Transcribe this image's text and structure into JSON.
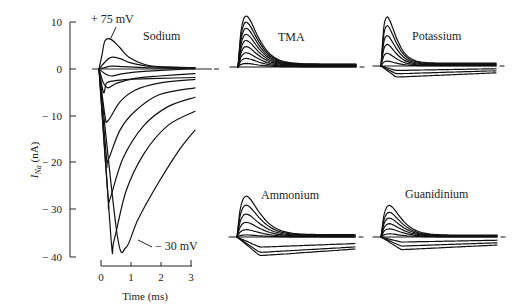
{
  "chart_data": [
    {
      "type": "line",
      "panel": "Sodium",
      "title": "Sodium",
      "xlabel": "Time (ms)",
      "ylabel": "I_Na (nA)",
      "xlim": [
        0,
        3.2
      ],
      "ylim": [
        -40,
        10
      ],
      "xticks": [
        0,
        1,
        2,
        3
      ],
      "yticks": [
        10,
        0,
        -10,
        -20,
        -30,
        -40
      ],
      "ytick_labels": [
        "10",
        "0",
        "− 10",
        "− 20",
        "− 30",
        "− 40"
      ],
      "grid": false,
      "annotations": [
        {
          "text": "+ 75 mV",
          "points_to": "top outward trace",
          "x": 0.4,
          "y": 6
        },
        {
          "text": "− 30 mV",
          "points_to": "deepest inward trace",
          "x": 0.9,
          "y": -38
        }
      ],
      "series": [
        {
          "name": "+75 mV",
          "x": [
            0,
            0.1,
            0.2,
            0.4,
            0.7,
            1.0,
            1.5,
            2.0,
            3.0,
            3.2
          ],
          "y": [
            0,
            3,
            6,
            6.3,
            4.5,
            2.5,
            1.0,
            0.5,
            0.3,
            0.3
          ]
        },
        {
          "name": "+55 mV",
          "x": [
            0,
            0.2,
            0.4,
            0.7,
            1.0,
            1.5,
            2.0,
            3.0,
            3.2
          ],
          "y": [
            0,
            1.5,
            2.5,
            2.2,
            1.4,
            0.7,
            0.4,
            0.3,
            0.3
          ]
        },
        {
          "name": "+35 mV",
          "x": [
            0,
            0.2,
            0.4,
            0.8,
            1.5,
            2.0,
            3.0,
            3.2
          ],
          "y": [
            0,
            0.3,
            0.6,
            0.5,
            0.3,
            0.2,
            0.1,
            0.1
          ]
        },
        {
          "name": "+20 mV",
          "x": [
            0,
            0.2,
            0.4,
            0.8,
            1.5,
            3.0,
            3.2
          ],
          "y": [
            0,
            -1.0,
            -1.5,
            -1.0,
            -0.5,
            0,
            0
          ]
        },
        {
          "name": "+10 mV",
          "x": [
            0,
            0.15,
            0.3,
            0.6,
            1.2,
            2.0,
            3.2
          ],
          "y": [
            0,
            -3,
            -4,
            -3,
            -2,
            -1.5,
            -1.0
          ]
        },
        {
          "name": "0 mV",
          "x": [
            0,
            0.15,
            0.25,
            0.5,
            1.0,
            2.0,
            3.2
          ],
          "y": [
            0,
            -5,
            -3,
            -2.5,
            -2.2,
            -2.0,
            -1.8
          ]
        },
        {
          "name": "-5 mV",
          "x": [
            0,
            0.2,
            0.3,
            0.7,
            1.2,
            2.0,
            3.2
          ],
          "y": [
            0,
            -10,
            -11,
            -7,
            -4.5,
            -3,
            -2.2
          ]
        },
        {
          "name": "-10 mV",
          "x": [
            0,
            0.25,
            0.3,
            0.7,
            1.2,
            2.0,
            3.2
          ],
          "y": [
            0,
            -19,
            -19.5,
            -13,
            -9,
            -5.5,
            -4.0
          ]
        },
        {
          "name": "-15 mV",
          "x": [
            0,
            0.3,
            0.35,
            0.8,
            1.5,
            2.3,
            3.2
          ],
          "y": [
            0,
            -27,
            -28,
            -19,
            -12,
            -8,
            -6
          ]
        },
        {
          "name": "-20 mV",
          "x": [
            0,
            0.4,
            0.5,
            0.9,
            1.5,
            2.3,
            3.2
          ],
          "y": [
            0,
            -36,
            -36.5,
            -26,
            -18,
            -12,
            -9
          ]
        },
        {
          "name": "-30 mV",
          "x": [
            0,
            0.6,
            0.9,
            1.3,
            2.0,
            2.7,
            3.2
          ],
          "y": [
            0,
            -35,
            -38,
            -32,
            -24,
            -17,
            -13
          ]
        }
      ]
    },
    {
      "type": "line",
      "panel": "TMA",
      "title": "TMA",
      "description": "Family of outward transient currents; all traces above baseline, fast rise, slow decay",
      "series_count": 9,
      "relative_peaks": [
        1.0,
        0.88,
        0.76,
        0.64,
        0.52,
        0.4,
        0.28,
        0.17,
        0.07
      ]
    },
    {
      "type": "line",
      "panel": "Potassium",
      "title": "Potassium",
      "description": "Outward transients plus several small inward traces below baseline",
      "series_count": 9,
      "relative_peaks": [
        1.0,
        0.82,
        0.62,
        0.44,
        0.26,
        0.1,
        -0.08,
        -0.14,
        -0.2
      ]
    },
    {
      "type": "line",
      "panel": "Ammonium",
      "title": "Ammonium",
      "description": "Outward transients plus larger inward traces below baseline",
      "series_count": 9,
      "relative_peaks": [
        1.0,
        0.78,
        0.56,
        0.36,
        0.18,
        0.05,
        -0.25,
        -0.38,
        -0.46
      ]
    },
    {
      "type": "line",
      "panel": "Guanidinium",
      "title": "Guanidinium",
      "description": "Smaller outward transients with dense noisy traces near baseline and small inward traces",
      "series_count": 9,
      "relative_peaks": [
        1.0,
        0.78,
        0.6,
        0.42,
        0.26,
        0.1,
        -0.1,
        -0.18,
        -0.25
      ]
    }
  ],
  "labels": {
    "sodium": "Sodium",
    "tma": "TMA",
    "potassium": "Potassium",
    "ammonium": "Ammonium",
    "guanidinium": "Guanidinium",
    "ann_top": "+ 75 mV",
    "ann_bottom": "− 30 mV",
    "xlabel": "Time (ms)",
    "ylabel_main": "I",
    "ylabel_sub": "Na",
    "ylabel_unit": " (nA)",
    "yticks": [
      "10",
      "0",
      "− 10",
      "− 20",
      "− 30",
      "− 40"
    ],
    "xticks": [
      "0",
      "1",
      "2",
      "3"
    ]
  }
}
